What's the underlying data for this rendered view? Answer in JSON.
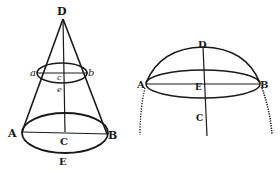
{
  "figures": {
    "cone": {
      "labels": {
        "apex": "D",
        "small_left": "a",
        "small_right": "b",
        "small_center": "c",
        "small_bottom": "e",
        "base_left": "A",
        "base_right": "B",
        "base_center": "C",
        "base_bottom": "E"
      }
    },
    "dome": {
      "labels": {
        "top": "D",
        "left": "A",
        "right": "B",
        "center": "E",
        "below": "C"
      }
    }
  },
  "colors": {
    "ink": "#1a1a1a",
    "paper": "#ffffff"
  }
}
